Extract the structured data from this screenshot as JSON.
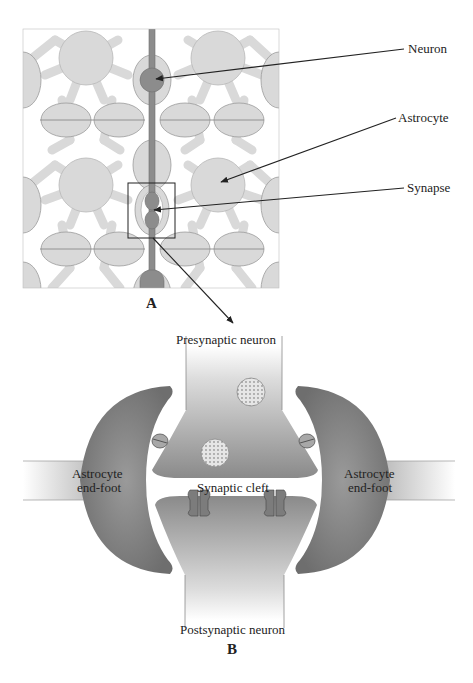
{
  "figure": {
    "panel_a": {
      "letter": "A",
      "labels": {
        "neuron": "Neuron",
        "astrocyte": "Astrocyte",
        "synapse": "Synapse"
      }
    },
    "panel_b": {
      "letter": "B",
      "labels": {
        "presynaptic": "Presynaptic neuron",
        "postsynaptic": "Postsynaptic neuron",
        "cleft": "Synaptic cleft",
        "endfoot_left_line1": "Astrocyte",
        "endfoot_left_line2": "end-foot",
        "endfoot_right_line1": "Astrocyte",
        "endfoot_right_line2": "end-foot"
      }
    },
    "colors": {
      "astrocyte_fill": "#d9d9d9",
      "astrocyte_stroke": "#9a9a9a",
      "neuron_fill": "#8c8c8c",
      "endfoot_dark": "#7a7a7a",
      "line": "#222222"
    }
  }
}
